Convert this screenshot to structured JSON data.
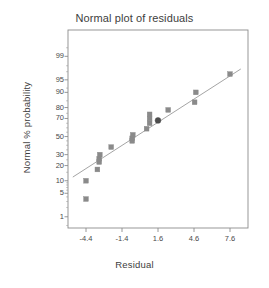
{
  "chart_data": {
    "type": "scatter",
    "title": "Normal plot of residuals",
    "xlabel": "Residual",
    "ylabel": "Normal % probability",
    "grid": false,
    "legend": "none",
    "xlim": [
      -5.9,
      9.1
    ],
    "xticks": [
      "-4.4",
      "-1.4",
      "1.6",
      "4.6",
      "7.6"
    ],
    "xtick_values": [
      -4.4,
      -1.4,
      1.6,
      4.6,
      7.6
    ],
    "yscale": "normal-probability",
    "yticks": [
      "99",
      "95",
      "90",
      "80",
      "70",
      "50",
      "30",
      "20",
      "10",
      "5",
      "1"
    ],
    "ytick_values": [
      99,
      95,
      90,
      80,
      70,
      50,
      30,
      20,
      10,
      5,
      1
    ],
    "ylim": [
      0.4,
      99.9
    ],
    "series": [
      {
        "name": "residual-points",
        "marker": "square",
        "color": "#8a8a8a",
        "points": [
          {
            "x": -4.4,
            "y": 3.5
          },
          {
            "x": -4.4,
            "y": 10.0
          },
          {
            "x": -3.45,
            "y": 17.0
          },
          {
            "x": -3.3,
            "y": 23.0
          },
          {
            "x": -3.3,
            "y": 26.0
          },
          {
            "x": -3.25,
            "y": 30.0
          },
          {
            "x": -2.3,
            "y": 38.0
          },
          {
            "x": -0.55,
            "y": 45.0
          },
          {
            "x": -0.55,
            "y": 48.0
          },
          {
            "x": -0.5,
            "y": 52.0
          },
          {
            "x": 0.65,
            "y": 59.0
          },
          {
            "x": 0.9,
            "y": 65.0
          },
          {
            "x": 0.9,
            "y": 70.0
          },
          {
            "x": 0.9,
            "y": 74.0
          },
          {
            "x": 2.45,
            "y": 78.0
          },
          {
            "x": 4.65,
            "y": 84.0
          },
          {
            "x": 4.75,
            "y": 90.0
          },
          {
            "x": 7.6,
            "y": 96.5
          }
        ]
      },
      {
        "name": "highlighted-point",
        "marker": "circle-filled",
        "color": "#4d4d4d",
        "points": [
          {
            "x": 1.6,
            "y": 68.0
          }
        ]
      }
    ],
    "fit_line": {
      "name": "reference-line",
      "color": "#9a9a9a",
      "x_start": -5.5,
      "y_start": 12.0,
      "x_end": 8.5,
      "y_end": 97.5
    }
  },
  "colors": {
    "frame": "#8c8c8c",
    "tick": "#8c8c8c",
    "marker": "#8a8a8a",
    "marker_highlight": "#4d4d4d",
    "line": "#9a9a9a",
    "text": "#3d3d3d",
    "background": "#ffffff"
  }
}
